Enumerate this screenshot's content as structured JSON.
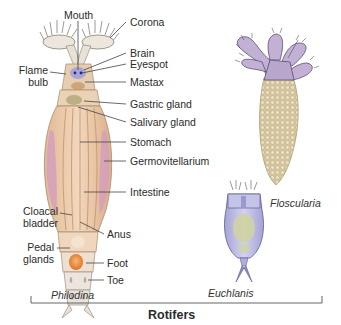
{
  "figure": {
    "title": "Rotifers",
    "specimens": [
      {
        "name": "Philodina"
      },
      {
        "name": "Floscularia"
      },
      {
        "name": "Euchlanis"
      }
    ],
    "philodina_labels": {
      "mouth": "Mouth",
      "corona": "Corona",
      "brain": "Brain",
      "eyespot": "Eyespot",
      "flame_bulb_1": "Flame",
      "flame_bulb_2": "bulb",
      "mastax": "Mastax",
      "gastric_gland": "Gastric gland",
      "salivary_gland": "Salivary gland",
      "stomach": "Stomach",
      "germovitellarium": "Germovitellarium",
      "intestine": "Intestine",
      "cloacal_bladder_1": "Cloacal",
      "cloacal_bladder_2": "bladder",
      "anus": "Anus",
      "pedal_glands_1": "Pedal",
      "pedal_glands_2": "glands",
      "foot": "Foot",
      "toe": "Toe"
    },
    "colors": {
      "philodina_body": "#e9c7a6",
      "philodina_stripe": "#d9a77f",
      "germovitellarium": "#c99ab8",
      "floscularia_tube": "#d8c9a4",
      "floscularia_head": "#b6a4c8",
      "euchlanis_body": "#b9b8e0",
      "euchlanis_gut": "#c9cf9e",
      "cloacal_bladder": "#e88a3a",
      "eyespot": "#7a7fd0",
      "line": "#444444"
    }
  }
}
